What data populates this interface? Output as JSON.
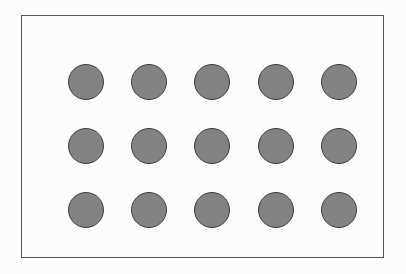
{
  "figure": {
    "name": "dot-grid-figure",
    "canvas": {
      "width": 406,
      "height": 274,
      "background_color": "#fcfcfc"
    },
    "frame": {
      "name": "panel-border",
      "left": 21,
      "top": 15,
      "width": 363,
      "height": 243,
      "border_width": 1,
      "border_color": "#555555",
      "fill_color": "#fbfbfb"
    },
    "grid": {
      "rows": 3,
      "columns": 5,
      "total_items": 15,
      "column_centers": [
        72,
        139,
        205,
        269,
        335
      ],
      "row_centers": [
        68,
        136,
        206
      ],
      "column_pitch": 66,
      "row_pitch": 69,
      "left": 54,
      "top": 50,
      "width": 317,
      "height": 192
    },
    "dot": {
      "shape": "circle",
      "diameter": 36,
      "fill_color": "#828282",
      "outline_color": "#3d3d3d",
      "outline_width": 1
    },
    "items": [
      {
        "id": "dot-r1-c1",
        "row": 1,
        "column": 1,
        "cx": 72,
        "cy": 68
      },
      {
        "id": "dot-r1-c2",
        "row": 1,
        "column": 2,
        "cx": 139,
        "cy": 68
      },
      {
        "id": "dot-r1-c3",
        "row": 1,
        "column": 3,
        "cx": 205,
        "cy": 68
      },
      {
        "id": "dot-r1-c4",
        "row": 1,
        "column": 4,
        "cx": 269,
        "cy": 68
      },
      {
        "id": "dot-r1-c5",
        "row": 1,
        "column": 5,
        "cx": 335,
        "cy": 68
      },
      {
        "id": "dot-r2-c1",
        "row": 2,
        "column": 1,
        "cx": 72,
        "cy": 136
      },
      {
        "id": "dot-r2-c2",
        "row": 2,
        "column": 2,
        "cx": 139,
        "cy": 136
      },
      {
        "id": "dot-r2-c3",
        "row": 2,
        "column": 3,
        "cx": 205,
        "cy": 136
      },
      {
        "id": "dot-r2-c4",
        "row": 2,
        "column": 4,
        "cx": 269,
        "cy": 136
      },
      {
        "id": "dot-r2-c5",
        "row": 2,
        "column": 5,
        "cx": 335,
        "cy": 136
      },
      {
        "id": "dot-r3-c1",
        "row": 3,
        "column": 1,
        "cx": 72,
        "cy": 206
      },
      {
        "id": "dot-r3-c2",
        "row": 3,
        "column": 2,
        "cx": 139,
        "cy": 206
      },
      {
        "id": "dot-r3-c3",
        "row": 3,
        "column": 3,
        "cx": 205,
        "cy": 206
      },
      {
        "id": "dot-r3-c4",
        "row": 3,
        "column": 4,
        "cx": 269,
        "cy": 206
      },
      {
        "id": "dot-r3-c5",
        "row": 3,
        "column": 5,
        "cx": 335,
        "cy": 206
      }
    ]
  }
}
